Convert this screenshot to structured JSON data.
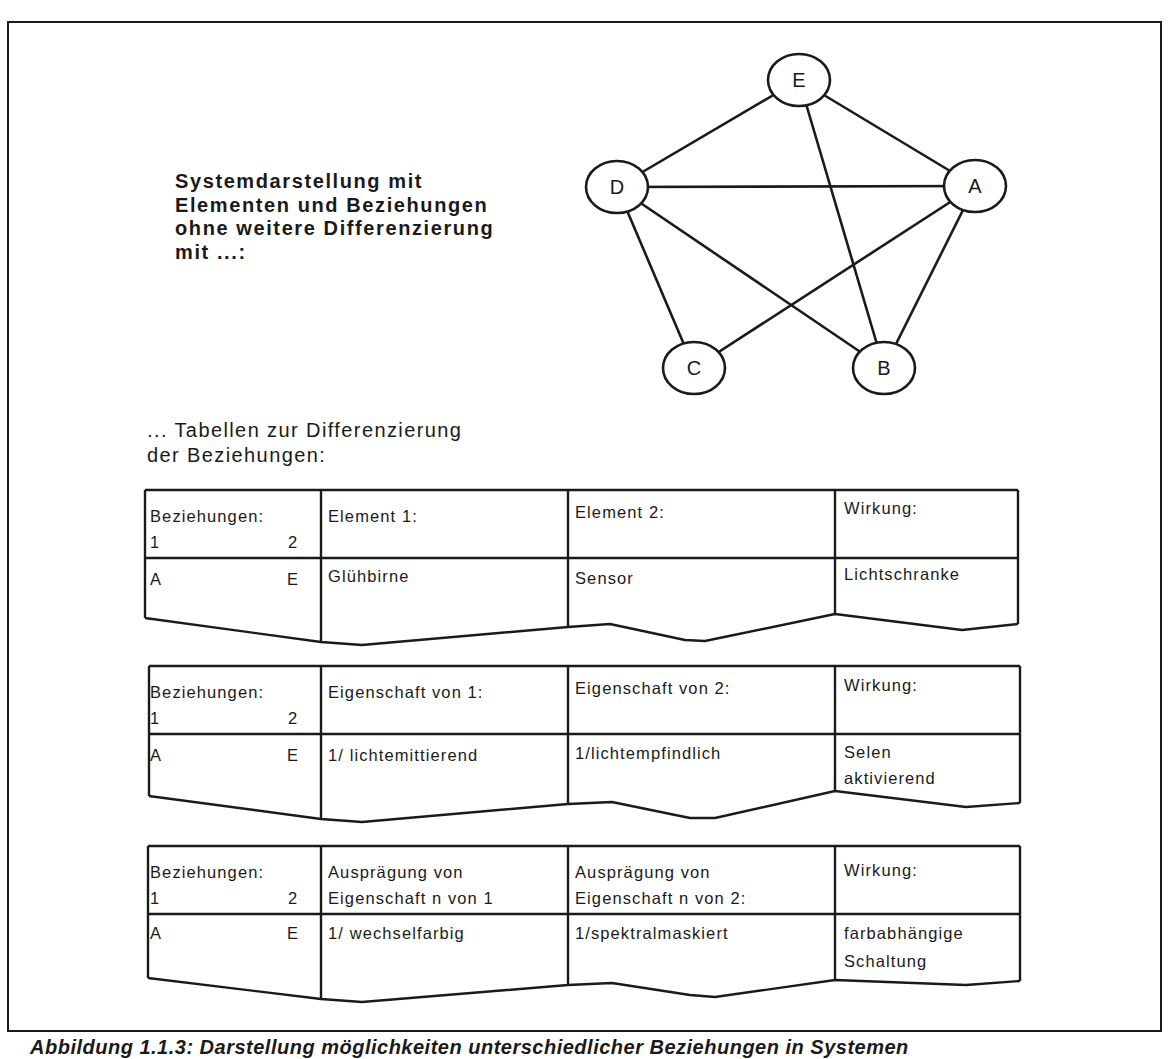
{
  "heading": {
    "lines": [
      "Systemdarstellung mit",
      "Elementen und Beziehungen",
      "ohne weitere Differenzierung",
      "mit ...:"
    ]
  },
  "graph": {
    "nodes": [
      {
        "id": "E",
        "label": "E",
        "x": 799,
        "y": 80
      },
      {
        "id": "D",
        "label": "D",
        "x": 617,
        "y": 187
      },
      {
        "id": "A",
        "label": "A",
        "x": 975,
        "y": 186
      },
      {
        "id": "C",
        "label": "C",
        "x": 694,
        "y": 368
      },
      {
        "id": "B",
        "label": "B",
        "x": 884,
        "y": 368
      }
    ],
    "edges": [
      [
        "E",
        "D"
      ],
      [
        "E",
        "A"
      ],
      [
        "E",
        "B"
      ],
      [
        "D",
        "A"
      ],
      [
        "D",
        "C"
      ],
      [
        "D",
        "B"
      ],
      [
        "A",
        "C"
      ],
      [
        "A",
        "B"
      ]
    ]
  },
  "subheading": {
    "lines": [
      "... Tabellen zur Differenzierung",
      "der Beziehungen:"
    ]
  },
  "tables": [
    {
      "header": {
        "relation_label": "Beziehungen:",
        "relation_col1": "1",
        "relation_col2": "2",
        "col2": "Element 1:",
        "col2_line2": "",
        "col3": "Element 2:",
        "col3_line2": "",
        "col4": "Wirkung:"
      },
      "row": {
        "from": "A",
        "to": "E",
        "col2": "Glühbirne",
        "col3": "Sensor",
        "col4": "Lichtschranke",
        "col4_line2": ""
      }
    },
    {
      "header": {
        "relation_label": "Beziehungen:",
        "relation_col1": "1",
        "relation_col2": "2",
        "col2": "Eigenschaft von 1:",
        "col2_line2": "",
        "col3": "Eigenschaft von 2:",
        "col3_line2": "",
        "col4": "Wirkung:"
      },
      "row": {
        "from": "A",
        "to": "E",
        "col2": "1/ lichtemittierend",
        "col3": "1/lichtempfindlich",
        "col4": "Selen",
        "col4_line2": "aktivierend"
      }
    },
    {
      "header": {
        "relation_label": "Beziehungen:",
        "relation_col1": "1",
        "relation_col2": "2",
        "col2": "Ausprägung von",
        "col2_line2": "Eigenschaft n von 1",
        "col3": "Ausprägung von",
        "col3_line2": "Eigenschaft n von 2:",
        "col4": "Wirkung:"
      },
      "row": {
        "from": "A",
        "to": "E",
        "col2": "1/ wechselfarbig",
        "col3": "1/spektralmaskiert",
        "col4": "farbabhängige",
        "col4_line2": "Schaltung"
      }
    }
  ],
  "caption": "Abbildung 1.1.3: Darstellung möglichkeiten unterschiedlicher Beziehungen in Systemen",
  "colors": {
    "ink": "#1a1a1a",
    "background": "#ffffff"
  }
}
